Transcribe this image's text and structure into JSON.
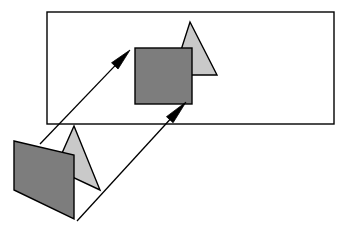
{
  "canvas": {
    "width": 349,
    "height": 237,
    "background": "#ffffff",
    "title": "projection-diagram"
  },
  "palette": {
    "dark_fill": "#7d7d7d",
    "light_fill": "#c9c9c9",
    "stroke": "#000000",
    "frame_stroke": "#000000",
    "arrow_fill": "#000000",
    "background": "#ffffff"
  },
  "shapes": {
    "frame": {
      "label": "image-plane-frame",
      "kind": "rectangle",
      "x": 47,
      "y": 12,
      "width": 287,
      "height": 112,
      "fill": "none",
      "stroke": "#000000",
      "stroke_width": 1.4
    },
    "projected_square": {
      "label": "projected-square",
      "kind": "rectangle",
      "x": 135,
      "y": 48,
      "width": 57,
      "height": 56,
      "fill": "#7d7d7d",
      "stroke": "#000000",
      "stroke_width": 1.4
    },
    "projected_triangle": {
      "label": "projected-triangle",
      "kind": "polygon",
      "points": "190,22 217,75 173,75",
      "fill": "#c9c9c9",
      "stroke": "#000000",
      "stroke_width": 1.4
    },
    "source_triangle": {
      "label": "source-triangle",
      "kind": "polygon",
      "points": "74,126 100,190 55,169",
      "fill": "#c9c9c9",
      "stroke": "#000000",
      "stroke_width": 1.4
    },
    "source_parallelogram": {
      "label": "source-parallelogram",
      "kind": "polygon",
      "points": "14,141 74,155 74,219 14,190",
      "fill": "#7d7d7d",
      "stroke": "#000000",
      "stroke_width": 1.4
    }
  },
  "arrows": [
    {
      "label": "projection-arrow-upper",
      "from_x": 40,
      "from_y": 144,
      "to_x": 130,
      "to_y": 50,
      "stroke": "#000000",
      "stroke_width": 1.3,
      "head_length": 22,
      "head_width": 9
    },
    {
      "label": "projection-arrow-lower",
      "from_x": 77,
      "from_y": 221,
      "to_x": 186,
      "to_y": 102,
      "stroke": "#000000",
      "stroke_width": 1.3,
      "head_length": 24,
      "head_width": 9
    }
  ]
}
